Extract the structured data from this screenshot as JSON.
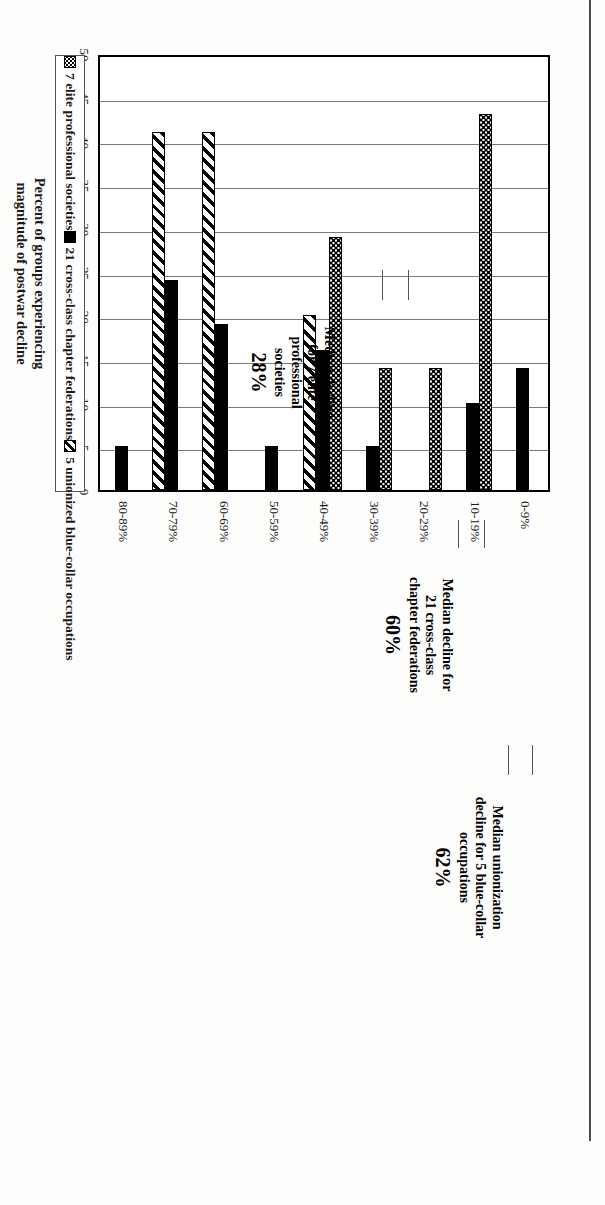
{
  "figure": {
    "title": "than Elite Professional Societies",
    "value_axis_title_line1": "Percent of groups experiencing",
    "value_axis_title_line2": "magnitude of postwar decline"
  },
  "legend": {
    "items": [
      {
        "label": "7 elite professional societies",
        "pattern": "dotted",
        "name": "legend-item-elite-professional-societies"
      },
      {
        "label": "21 cross-class chapter federations",
        "pattern": "solid-black",
        "name": "legend-item-cross-class-chapter-federations"
      },
      {
        "label": "5 unionized blue-collar occupations",
        "pattern": "diagonal-hatch",
        "name": "legend-item-unionized-blue-collar-occupations"
      }
    ]
  },
  "annotations": [
    {
      "line1": "Median decline",
      "line2": "for 7 elite",
      "line3": "professional",
      "line4": "societies",
      "percent": "28%"
    },
    {
      "line1": "Median decline for",
      "line2": "21 cross-class",
      "line3": "chapter federations",
      "line4": "",
      "percent": "60%"
    },
    {
      "line1": "Median unionization",
      "line2": "decline for 5 blue-collar",
      "line3": "occupations",
      "line4": "",
      "percent": "62%"
    }
  ],
  "chart_data": {
    "type": "bar",
    "orientation": "vertical-clustered",
    "title": "than Elite Professional Societies",
    "xlabel": "",
    "ylabel": "Percent of groups experiencing magnitude of postwar decline",
    "ylim": [
      0,
      50
    ],
    "ytick_step": 5,
    "yticks": [
      0,
      5,
      10,
      15,
      20,
      25,
      30,
      35,
      40,
      45,
      50
    ],
    "ytick_labels": [
      "0",
      "5",
      "10",
      "15",
      "20",
      "25",
      "30",
      "35",
      "40",
      "45",
      "50"
    ],
    "grid": true,
    "legend_position": "bottom",
    "categories": [
      "0-9%",
      "10-19%",
      "20-29%",
      "30-39%",
      "40-49%",
      "50-59%",
      "60-69%",
      "70-79%",
      "80-89%"
    ],
    "series": [
      {
        "name": "7 elite professional societies",
        "pattern": "dotted",
        "values": [
          0,
          43,
          14,
          14,
          29,
          0,
          0,
          0,
          0
        ]
      },
      {
        "name": "21 cross-class chapter federations",
        "pattern": "solid-black",
        "values": [
          14,
          10,
          0,
          5,
          16,
          5,
          19,
          24,
          5
        ]
      },
      {
        "name": "5 unionized blue-collar occupations",
        "pattern": "diagonal-hatch",
        "values": [
          0,
          0,
          0,
          0,
          20,
          0,
          41,
          41,
          0
        ]
      }
    ]
  }
}
